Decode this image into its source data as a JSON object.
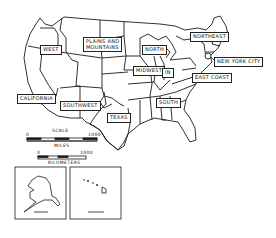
{
  "map": {
    "title": "United States regions",
    "regions": [
      {
        "id": "west",
        "label": "WEST"
      },
      {
        "id": "plains",
        "label_line1": "PLAINS AND",
        "label_line2": "MOUNTAINS"
      },
      {
        "id": "north",
        "label": "NORTH"
      },
      {
        "id": "northeast",
        "label": "NORTHEAST"
      },
      {
        "id": "nyc",
        "label": "NEW YORK CITY"
      },
      {
        "id": "midwest",
        "label": "MIDWEST"
      },
      {
        "id": "in",
        "label": "IN"
      },
      {
        "id": "eastcoast",
        "label": "EAST COAST"
      },
      {
        "id": "california",
        "label": "CALIFORNIA"
      },
      {
        "id": "southwest",
        "label": "SOUTHWEST"
      },
      {
        "id": "texas",
        "label": "TEXAS"
      },
      {
        "id": "south",
        "label": "SOUTH"
      }
    ],
    "scale": {
      "title": "SCALE",
      "miles_start": "0",
      "miles_end": "1000",
      "miles_label": "MILES",
      "km_start": "0",
      "km_end": "1000",
      "km_label": "KILOMETERS"
    },
    "insets": [
      {
        "id": "alaska",
        "name": "Alaska inset"
      },
      {
        "id": "hawaii",
        "name": "Hawaii inset"
      }
    ]
  }
}
